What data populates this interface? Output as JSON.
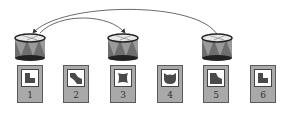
{
  "diagram": {
    "drums": [
      {
        "position": 1,
        "x": 13
      },
      {
        "position": 3,
        "x": 106
      },
      {
        "position": 5,
        "x": 200
      }
    ],
    "arrows": [
      {
        "from": 5,
        "to": 1,
        "label": ""
      },
      {
        "from": 1,
        "to": 3,
        "label": ""
      }
    ],
    "cards": [
      {
        "number": "1",
        "shape": "l-shape"
      },
      {
        "number": "2",
        "shape": "bent-block"
      },
      {
        "number": "3",
        "shape": "spool"
      },
      {
        "number": "4",
        "shape": "cat-head"
      },
      {
        "number": "5",
        "shape": "notched-block"
      },
      {
        "number": "6",
        "shape": "l-shape"
      }
    ]
  },
  "colors": {
    "drum_body": "#6e6e6e",
    "drum_triangle": "#9a9a9a",
    "card_bg": "#a9a9a9",
    "shape_fill": "#4a4a4a"
  }
}
